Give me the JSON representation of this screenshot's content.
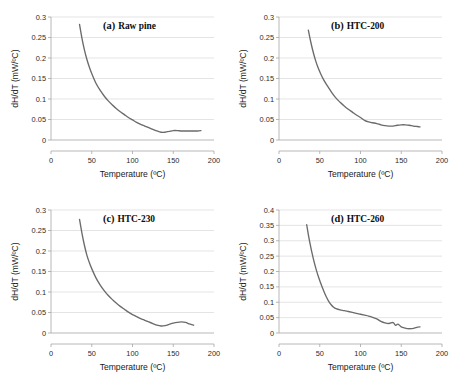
{
  "figure": {
    "name": "dsc-derivative-thermograms",
    "background": "#ffffff",
    "curve_color": "#6b6b6b",
    "grid_color": "#d9d9d9",
    "axis_color": "#a6a6a6"
  },
  "chart_data": [
    {
      "type": "line",
      "panel": "a",
      "panel_label": "(a)",
      "title": "Raw pine",
      "xlabel": "Temperature (ºC)",
      "ylabel": "dH/dT (mW/ºC)",
      "xlim": [
        0,
        200
      ],
      "ylim": [
        0,
        0.3
      ],
      "xticks": [
        0,
        50,
        100,
        150,
        200
      ],
      "yticks": [
        0,
        0.05,
        0.1,
        0.15,
        0.2,
        0.25,
        0.3
      ],
      "xticklabels": [
        "0",
        "50",
        "100",
        "150",
        "200"
      ],
      "yticklabels": [
        "0",
        "0.05",
        "0.1",
        "0.15",
        "0.2",
        "0.25",
        "0.3"
      ],
      "grid": true,
      "legend": "none",
      "x": [
        35,
        38,
        41,
        44,
        47,
        50,
        55,
        60,
        65,
        70,
        75,
        80,
        85,
        90,
        95,
        100,
        105,
        110,
        115,
        120,
        125,
        130,
        135,
        140,
        145,
        150,
        155,
        160,
        165,
        170,
        175,
        180,
        184
      ],
      "y": [
        0.282,
        0.248,
        0.22,
        0.197,
        0.178,
        0.162,
        0.139,
        0.122,
        0.108,
        0.096,
        0.086,
        0.077,
        0.069,
        0.062,
        0.055,
        0.049,
        0.043,
        0.038,
        0.034,
        0.03,
        0.026,
        0.022,
        0.019,
        0.019,
        0.021,
        0.023,
        0.023,
        0.022,
        0.022,
        0.022,
        0.022,
        0.022,
        0.023
      ]
    },
    {
      "type": "line",
      "panel": "b",
      "panel_label": "(b)",
      "title": "HTC-200",
      "xlabel": "Temperature (ºC)",
      "ylabel": "dH/dT (mW/ºC)",
      "xlim": [
        0,
        200
      ],
      "ylim": [
        0,
        0.3
      ],
      "xticks": [
        0,
        50,
        100,
        150,
        200
      ],
      "yticks": [
        0,
        0.05,
        0.1,
        0.15,
        0.2,
        0.25,
        0.3
      ],
      "xticklabels": [
        "0",
        "50",
        "100",
        "150",
        "200"
      ],
      "yticklabels": [
        "0",
        "0.05",
        "0.1",
        "0.15",
        "0.2",
        "0.25",
        "0.3"
      ],
      "grid": true,
      "legend": "none",
      "x": [
        36,
        39,
        42,
        45,
        48,
        51,
        55,
        60,
        65,
        70,
        75,
        80,
        85,
        90,
        95,
        100,
        105,
        110,
        115,
        120,
        125,
        130,
        135,
        140,
        145,
        150,
        155,
        160,
        165,
        170,
        173
      ],
      "y": [
        0.268,
        0.239,
        0.214,
        0.193,
        0.176,
        0.162,
        0.146,
        0.13,
        0.115,
        0.102,
        0.092,
        0.083,
        0.075,
        0.068,
        0.061,
        0.055,
        0.048,
        0.044,
        0.042,
        0.04,
        0.037,
        0.035,
        0.034,
        0.034,
        0.036,
        0.037,
        0.037,
        0.036,
        0.034,
        0.033,
        0.032
      ]
    },
    {
      "type": "line",
      "panel": "c",
      "panel_label": "(c)",
      "title": "HTC-230",
      "xlabel": "Temperature (ºC)",
      "ylabel": "dH/dT (mW/ºC)",
      "xlim": [
        0,
        200
      ],
      "ylim": [
        0,
        0.3
      ],
      "xticks": [
        0,
        50,
        100,
        150,
        200
      ],
      "yticks": [
        0,
        0.05,
        0.1,
        0.15,
        0.2,
        0.25,
        0.3
      ],
      "xticklabels": [
        "0",
        "50",
        "100",
        "150",
        "200"
      ],
      "yticklabels": [
        "0",
        "0.05",
        "0.1",
        "0.15",
        "0.2",
        "0.25",
        "0.3"
      ],
      "grid": true,
      "legend": "none",
      "x": [
        35,
        38,
        41,
        44,
        47,
        50,
        55,
        60,
        65,
        70,
        75,
        80,
        85,
        90,
        95,
        100,
        105,
        110,
        115,
        120,
        125,
        130,
        135,
        140,
        145,
        150,
        155,
        160,
        165,
        170,
        175
      ],
      "y": [
        0.277,
        0.243,
        0.214,
        0.19,
        0.172,
        0.157,
        0.135,
        0.118,
        0.104,
        0.092,
        0.082,
        0.073,
        0.065,
        0.058,
        0.051,
        0.045,
        0.04,
        0.035,
        0.031,
        0.027,
        0.023,
        0.019,
        0.017,
        0.018,
        0.021,
        0.024,
        0.026,
        0.027,
        0.026,
        0.022,
        0.019
      ]
    },
    {
      "type": "line",
      "panel": "d",
      "panel_label": "(d)",
      "title": "HTC-260",
      "xlabel": "Temperature (ºC)",
      "ylabel": "dH/dT (mW/ºC)",
      "xlim": [
        0,
        200
      ],
      "ylim": [
        0,
        0.4
      ],
      "xticks": [
        0,
        50,
        100,
        150,
        200
      ],
      "yticks": [
        0,
        0.05,
        0.1,
        0.15,
        0.2,
        0.25,
        0.3,
        0.35,
        0.4
      ],
      "xticklabels": [
        "0",
        "50",
        "100",
        "150",
        "200"
      ],
      "yticklabels": [
        "0",
        "0.05",
        "0.1",
        "0.15",
        "0.2",
        "0.25",
        "0.3",
        "0.35",
        "0.4"
      ],
      "grid": true,
      "legend": "none",
      "x": [
        34,
        36,
        38,
        40,
        43,
        46,
        49,
        52,
        55,
        58,
        61,
        64,
        67,
        70,
        75,
        80,
        85,
        90,
        95,
        100,
        105,
        110,
        115,
        120,
        125,
        130,
        135,
        140,
        143,
        146,
        150,
        155,
        158,
        162,
        166,
        170,
        173
      ],
      "y": [
        0.352,
        0.32,
        0.292,
        0.266,
        0.232,
        0.203,
        0.178,
        0.156,
        0.136,
        0.118,
        0.103,
        0.092,
        0.084,
        0.079,
        0.075,
        0.073,
        0.07,
        0.067,
        0.064,
        0.061,
        0.058,
        0.055,
        0.051,
        0.046,
        0.038,
        0.033,
        0.031,
        0.034,
        0.025,
        0.029,
        0.02,
        0.016,
        0.014,
        0.014,
        0.016,
        0.019,
        0.02
      ]
    }
  ]
}
